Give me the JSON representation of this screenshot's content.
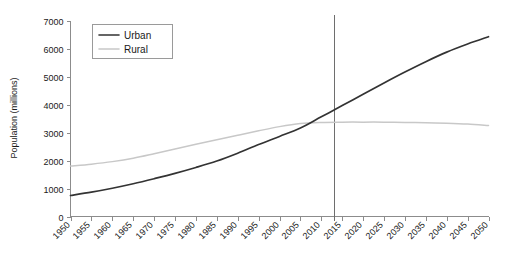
{
  "chart_data": {
    "type": "line",
    "title": "",
    "xlabel": "",
    "ylabel": "Population (millions)",
    "xlim": [
      1950,
      2050
    ],
    "ylim": [
      0,
      7000
    ],
    "grid": false,
    "legend_position": "top-left",
    "x": [
      1950,
      1955,
      1960,
      1965,
      1970,
      1975,
      1980,
      1985,
      1990,
      1995,
      2000,
      2005,
      2010,
      2015,
      2020,
      2025,
      2030,
      2035,
      2040,
      2045,
      2050
    ],
    "xticklabels": [
      "1950",
      "1955",
      "1960",
      "1965",
      "1970",
      "1975",
      "1980",
      "1985",
      "1990",
      "1995",
      "2000",
      "2005",
      "2010",
      "2015",
      "2020",
      "2025",
      "2030",
      "2035",
      "2040",
      "2045",
      "2050"
    ],
    "yticks": [
      0,
      1000,
      2000,
      3000,
      4000,
      5000,
      6000,
      7000
    ],
    "yticklabels": [
      "0",
      "1000",
      "2000",
      "3000",
      "4000",
      "5000",
      "6000",
      "7000"
    ],
    "series": [
      {
        "name": "Urban",
        "color": "#333333",
        "values": [
          750,
          870,
          1010,
          1170,
          1350,
          1540,
          1750,
          1980,
          2260,
          2570,
          2860,
          3160,
          3560,
          3960,
          4370,
          4770,
          5160,
          5530,
          5870,
          6160,
          6420
        ]
      },
      {
        "name": "Rural",
        "color": "#c8c8c8",
        "values": [
          1800,
          1870,
          1960,
          2080,
          2240,
          2410,
          2580,
          2740,
          2900,
          3060,
          3210,
          3320,
          3360,
          3370,
          3370,
          3370,
          3360,
          3350,
          3330,
          3300,
          3250
        ]
      }
    ],
    "annotations": [
      {
        "type": "vertical-line",
        "name": "reference-year-line",
        "x": 2013,
        "color": "#6e6e6e"
      }
    ]
  },
  "legend": {
    "entries": [
      {
        "label": "Urban"
      },
      {
        "label": "Rural"
      }
    ]
  },
  "axes": {
    "y_title": "Population (millions)"
  }
}
